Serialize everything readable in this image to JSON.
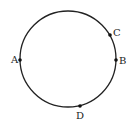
{
  "diagram": {
    "type": "circle-with-points",
    "circle": {
      "cx": 68,
      "cy": 59,
      "r": 48,
      "stroke": "#222222",
      "stroke_width": 1.3
    },
    "points": [
      {
        "name": "A",
        "x": 20,
        "y": 60,
        "label_x": 11,
        "label_y": 63
      },
      {
        "name": "B",
        "x": 116,
        "y": 60,
        "label_x": 119,
        "label_y": 64
      },
      {
        "name": "C",
        "x": 110,
        "y": 35,
        "label_x": 113,
        "label_y": 36
      },
      {
        "name": "D",
        "x": 80,
        "y": 106,
        "label_x": 76,
        "label_y": 119
      }
    ],
    "point_color": "#111111",
    "point_radius": 1.8
  }
}
